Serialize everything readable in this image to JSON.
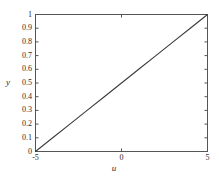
{
  "chart_data": {
    "type": "line",
    "title": "",
    "xlabel": "u",
    "ylabel": "y",
    "xlim": [
      -5,
      5
    ],
    "ylim": [
      0,
      1
    ],
    "grid": false,
    "legend": null,
    "x_ticks": [
      -5,
      0,
      5
    ],
    "x_tick_labels": [
      "-5",
      "0",
      "5"
    ],
    "y_ticks": [
      0,
      0.1,
      0.2,
      0.3,
      0.4,
      0.5,
      0.6,
      0.7,
      0.8,
      0.9,
      1
    ],
    "y_tick_labels": [
      "0",
      "0.1",
      "0.2",
      "0.3",
      "0.4",
      "0.5",
      "0.6",
      "0.7",
      "0.8",
      "0.9",
      "1"
    ],
    "series": [
      {
        "name": "line",
        "color": "#3a3a3a",
        "x": [
          -5,
          -4,
          -3,
          -2,
          -1,
          0,
          1,
          2,
          3,
          4,
          5
        ],
        "values": [
          0,
          0.1,
          0.2,
          0.3,
          0.4,
          0.5,
          0.6,
          0.7,
          0.8,
          0.9,
          1
        ]
      }
    ],
    "axes_color": "#555555",
    "background_color": "#ffffff"
  }
}
